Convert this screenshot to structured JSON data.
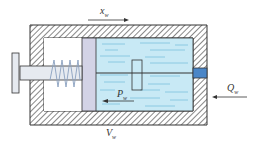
{
  "diagram": {
    "type": "hydraulic-cylinder-schematic",
    "labels": {
      "displacement": "x",
      "displacement_sub": "w",
      "pressure": "P",
      "pressure_sub": "w",
      "volume": "V",
      "volume_sub": "w",
      "flow": "Q",
      "flow_sub": "w"
    },
    "colors": {
      "housing_hatch": "#555555",
      "housing_fill": "#ffffff",
      "fluid": "#c8e9f5",
      "fluid_lines": "#7cc0dd",
      "piston": "#d3d3e6",
      "port": "#4a86c8",
      "rod": "#e6eaf0",
      "spring": "#8aa0c0",
      "outline": "#333333"
    },
    "components": [
      "housing",
      "piston",
      "piston-rod",
      "end-plate",
      "spring",
      "fluid-chamber",
      "inner-rod",
      "inner-block",
      "inlet-port"
    ]
  }
}
